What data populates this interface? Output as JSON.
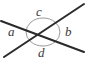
{
  "figure": {
    "type": "geometry-diagram",
    "background_color": "#ffffff",
    "line_color": "#2b2b2b",
    "arc_color": "#9a9a9a",
    "label_color": "#3a3a3a",
    "labels": {
      "a": "a",
      "b": "b",
      "c": "c",
      "d": "d"
    },
    "vertex": {
      "x": 43,
      "y": 32
    },
    "lines": [
      {
        "name": "line-upper-left-to-lower-right",
        "x1": 1,
        "y1": 21,
        "x2": 84,
        "y2": 52
      },
      {
        "name": "line-lower-left-to-upper-right",
        "x1": 4,
        "y1": 57,
        "x2": 84,
        "y2": 4
      }
    ],
    "angle_circle": {
      "name": "angle-marker-circle",
      "cx": 43,
      "cy": 32,
      "rx": 17,
      "ry": 14
    },
    "label_positions": {
      "a": {
        "x": 12,
        "y": 32
      },
      "b": {
        "x": 70,
        "y": 32
      },
      "c": {
        "x": 40,
        "y": 12
      },
      "d": {
        "x": 43,
        "y": 53
      }
    }
  }
}
